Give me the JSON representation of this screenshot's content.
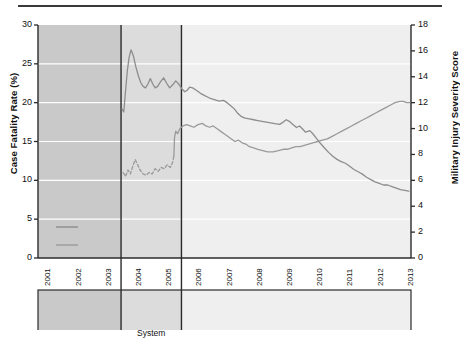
{
  "figure": {
    "background": "#ffffff",
    "top_rule_color": "#3a3a3a",
    "line_color_cfr": "#8d8d8d",
    "line_color_miss": "#9a9a9a",
    "band_colors": [
      "#c9c9c9",
      "#dcdcdc",
      "#efefef"
    ],
    "gridline_color": "#ffffff",
    "axis_color": "#2b2b2b"
  },
  "axes": {
    "left_title": "Case Fatality Rate (%)",
    "right_title": "Military Injury Severity Score",
    "left_ticks": [
      "0",
      "5",
      "10",
      "15",
      "20",
      "25",
      "30"
    ],
    "right_ticks": [
      "0",
      "2",
      "4",
      "6",
      "8",
      "10",
      "12",
      "14",
      "16",
      "18"
    ],
    "x_ticks": [
      "2001",
      "2002",
      "2003",
      "2004",
      "2005",
      "2006",
      "2007",
      "2008",
      "2009",
      "2010",
      "2011",
      "2012",
      "2013"
    ]
  },
  "legend": {
    "items": [
      {
        "label": "Cumulative Average of Combat Case Fatality Rate",
        "style": "solid",
        "color": "#8d8d8d"
      },
      {
        "label": "Cumulative Average of Military Injury Severity Score (mISS) in Combat",
        "style": "solid",
        "color": "#9a9a9a"
      }
    ]
  },
  "bands": [
    {
      "caption": "Absence of Combat Trauma Data",
      "start": 2001.0,
      "end": 2003.75,
      "shade": "#c9c9c9"
    },
    {
      "caption": "Development of Joint Trauma System",
      "start": 2003.75,
      "end": 2005.75,
      "shade": "#dcdcdc"
    },
    {
      "caption": "Maturation of JTS Data Collection",
      "start": 2005.75,
      "end": 2013.35,
      "shade": "#efefef"
    }
  ],
  "chart_data": {
    "type": "line",
    "title": "",
    "xlabel": "",
    "ylabel": "Case Fatality Rate (%)",
    "y2label": "Military Injury Severity Score",
    "xlim": [
      2001.0,
      2013.35
    ],
    "ylim": [
      0,
      30
    ],
    "y2lim": [
      0,
      18
    ],
    "grid": "horizontal-white",
    "legend_position": "bottom-inside",
    "series": [
      {
        "name": "Cumulative Average of Combat Case Fatality Rate",
        "axis": "left",
        "unit": "%",
        "style": "solid",
        "color": "#8d8d8d",
        "points": [
          [
            2003.78,
            19.2
          ],
          [
            2003.84,
            18.8
          ],
          [
            2003.9,
            21.6
          ],
          [
            2003.96,
            24.2
          ],
          [
            2004.02,
            25.9
          ],
          [
            2004.08,
            26.8
          ],
          [
            2004.16,
            26.0
          ],
          [
            2004.24,
            24.6
          ],
          [
            2004.32,
            23.5
          ],
          [
            2004.4,
            22.6
          ],
          [
            2004.48,
            22.1
          ],
          [
            2004.56,
            21.9
          ],
          [
            2004.64,
            22.4
          ],
          [
            2004.72,
            23.1
          ],
          [
            2004.8,
            22.4
          ],
          [
            2004.88,
            21.9
          ],
          [
            2004.96,
            22.1
          ],
          [
            2005.06,
            22.7
          ],
          [
            2005.16,
            23.2
          ],
          [
            2005.26,
            22.5
          ],
          [
            2005.36,
            21.9
          ],
          [
            2005.46,
            22.3
          ],
          [
            2005.56,
            22.8
          ],
          [
            2005.66,
            22.4
          ],
          [
            2005.76,
            21.8
          ],
          [
            2005.86,
            21.4
          ],
          [
            2005.94,
            21.6
          ],
          [
            2006.02,
            22.0
          ],
          [
            2006.12,
            21.9
          ],
          [
            2006.24,
            21.6
          ],
          [
            2006.38,
            21.2
          ],
          [
            2006.52,
            20.9
          ],
          [
            2006.68,
            20.6
          ],
          [
            2006.84,
            20.4
          ],
          [
            2007.0,
            20.2
          ],
          [
            2007.14,
            20.3
          ],
          [
            2007.26,
            20.0
          ],
          [
            2007.38,
            19.6
          ],
          [
            2007.5,
            19.2
          ],
          [
            2007.62,
            18.6
          ],
          [
            2007.74,
            18.2
          ],
          [
            2007.86,
            18.0
          ],
          [
            2008.0,
            17.9
          ],
          [
            2008.14,
            17.8
          ],
          [
            2008.28,
            17.7
          ],
          [
            2008.42,
            17.6
          ],
          [
            2008.56,
            17.5
          ],
          [
            2008.7,
            17.4
          ],
          [
            2008.84,
            17.3
          ],
          [
            2009.0,
            17.2
          ],
          [
            2009.12,
            17.5
          ],
          [
            2009.22,
            17.8
          ],
          [
            2009.32,
            17.6
          ],
          [
            2009.44,
            17.2
          ],
          [
            2009.56,
            16.8
          ],
          [
            2009.66,
            17.0
          ],
          [
            2009.76,
            16.6
          ],
          [
            2009.86,
            16.2
          ],
          [
            2010.0,
            16.4
          ],
          [
            2010.1,
            16.0
          ],
          [
            2010.22,
            15.4
          ],
          [
            2010.34,
            14.8
          ],
          [
            2010.48,
            14.2
          ],
          [
            2010.62,
            13.6
          ],
          [
            2010.76,
            13.1
          ],
          [
            2010.9,
            12.7
          ],
          [
            2011.04,
            12.4
          ],
          [
            2011.18,
            12.2
          ],
          [
            2011.32,
            11.8
          ],
          [
            2011.46,
            11.4
          ],
          [
            2011.6,
            11.1
          ],
          [
            2011.74,
            10.8
          ],
          [
            2011.88,
            10.4
          ],
          [
            2012.02,
            10.1
          ],
          [
            2012.16,
            9.8
          ],
          [
            2012.3,
            9.6
          ],
          [
            2012.44,
            9.4
          ],
          [
            2012.58,
            9.4
          ],
          [
            2012.72,
            9.2
          ],
          [
            2012.86,
            9.0
          ],
          [
            2013.0,
            8.8
          ],
          [
            2013.14,
            8.7
          ],
          [
            2013.28,
            8.6
          ]
        ]
      },
      {
        "name": "Cumulative Average of Military Injury Severity Score (mISS) in Combat",
        "axis": "right",
        "unit": "score",
        "style": "dashed-then-solid",
        "dashed_until": 2005.5,
        "color": "#9a9a9a",
        "points": [
          [
            2003.82,
            6.6
          ],
          [
            2003.9,
            6.3
          ],
          [
            2003.98,
            6.8
          ],
          [
            2004.06,
            6.5
          ],
          [
            2004.14,
            7.1
          ],
          [
            2004.22,
            7.6
          ],
          [
            2004.3,
            7.2
          ],
          [
            2004.38,
            6.8
          ],
          [
            2004.48,
            6.5
          ],
          [
            2004.58,
            6.4
          ],
          [
            2004.68,
            6.6
          ],
          [
            2004.78,
            6.5
          ],
          [
            2004.88,
            6.9
          ],
          [
            2004.98,
            6.7
          ],
          [
            2005.08,
            7.0
          ],
          [
            2005.18,
            6.9
          ],
          [
            2005.28,
            7.2
          ],
          [
            2005.38,
            7.0
          ],
          [
            2005.46,
            7.4
          ],
          [
            2005.5,
            7.9
          ],
          [
            2005.52,
            9.3
          ],
          [
            2005.56,
            9.8
          ],
          [
            2005.62,
            9.6
          ],
          [
            2005.7,
            10.0
          ],
          [
            2005.8,
            10.2
          ],
          [
            2005.92,
            10.3
          ],
          [
            2006.04,
            10.2
          ],
          [
            2006.16,
            10.1
          ],
          [
            2006.3,
            10.3
          ],
          [
            2006.44,
            10.4
          ],
          [
            2006.56,
            10.2
          ],
          [
            2006.68,
            10.1
          ],
          [
            2006.8,
            10.2
          ],
          [
            2006.92,
            10.0
          ],
          [
            2007.04,
            9.8
          ],
          [
            2007.16,
            9.6
          ],
          [
            2007.28,
            9.4
          ],
          [
            2007.4,
            9.2
          ],
          [
            2007.52,
            9.0
          ],
          [
            2007.64,
            9.1
          ],
          [
            2007.76,
            8.9
          ],
          [
            2007.88,
            8.8
          ],
          [
            2008.0,
            8.6
          ],
          [
            2008.14,
            8.5
          ],
          [
            2008.28,
            8.4
          ],
          [
            2008.44,
            8.3
          ],
          [
            2008.6,
            8.2
          ],
          [
            2008.78,
            8.2
          ],
          [
            2008.96,
            8.3
          ],
          [
            2009.12,
            8.4
          ],
          [
            2009.26,
            8.4
          ],
          [
            2009.4,
            8.5
          ],
          [
            2009.54,
            8.6
          ],
          [
            2009.68,
            8.6
          ],
          [
            2009.82,
            8.7
          ],
          [
            2009.96,
            8.8
          ],
          [
            2010.1,
            8.9
          ],
          [
            2010.26,
            9.0
          ],
          [
            2010.42,
            9.1
          ],
          [
            2010.58,
            9.2
          ],
          [
            2010.74,
            9.4
          ],
          [
            2010.9,
            9.6
          ],
          [
            2011.06,
            9.8
          ],
          [
            2011.22,
            10.0
          ],
          [
            2011.38,
            10.2
          ],
          [
            2011.54,
            10.4
          ],
          [
            2011.7,
            10.6
          ],
          [
            2011.86,
            10.8
          ],
          [
            2012.02,
            11.0
          ],
          [
            2012.18,
            11.2
          ],
          [
            2012.34,
            11.4
          ],
          [
            2012.5,
            11.6
          ],
          [
            2012.66,
            11.8
          ],
          [
            2012.82,
            12.0
          ],
          [
            2012.98,
            12.1
          ],
          [
            2013.1,
            12.1
          ],
          [
            2013.2,
            12.0
          ],
          [
            2013.3,
            12.0
          ]
        ]
      }
    ]
  }
}
